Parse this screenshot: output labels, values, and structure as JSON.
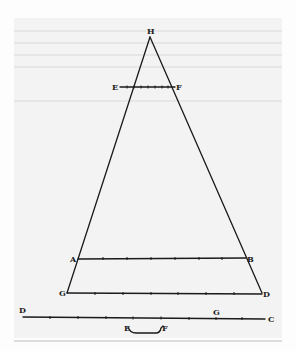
{
  "diagram": {
    "colors": {
      "ink": "#1a1a1a",
      "paper": "#f3f3f3",
      "bleed": "#e6e6e6"
    },
    "points": {
      "H": {
        "label": "H",
        "x": 150,
        "y": 37
      },
      "E": {
        "label": "E",
        "x": 120,
        "y": 87
      },
      "F": {
        "label": "F",
        "x": 175,
        "y": 87
      },
      "A": {
        "label": "A",
        "x": 78,
        "y": 259
      },
      "B": {
        "label": "B",
        "x": 246,
        "y": 259
      },
      "G": {
        "label": "G",
        "x": 67,
        "y": 293
      },
      "D": {
        "label": "D",
        "x": 262,
        "y": 293
      }
    },
    "scale_line": {
      "start_label": "D",
      "mid_label": "G",
      "end_label": "C",
      "tick_count": 9
    },
    "bracket": {
      "left_label": "E",
      "right_label": "F"
    },
    "segments": [
      {
        "name": "H-G",
        "from": "H",
        "to": "G"
      },
      {
        "name": "H-D",
        "from": "H",
        "to": "D"
      },
      {
        "name": "E-F",
        "from": "E",
        "to": "F",
        "ticks": 7
      },
      {
        "name": "A-B",
        "from": "A",
        "to": "B",
        "ticks": 6
      },
      {
        "name": "G-D",
        "from": "G",
        "to": "D",
        "ticks": 7
      }
    ]
  }
}
